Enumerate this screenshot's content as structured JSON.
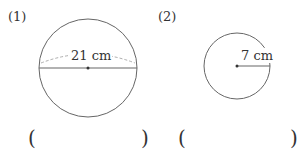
{
  "problems": [
    {
      "label": "(1)",
      "measure": "21 cm",
      "type": "diameter",
      "answer_open": "(",
      "answer_close": ")"
    },
    {
      "label": "(2)",
      "measure": "7 cm",
      "type": "radius",
      "answer_open": "(",
      "answer_close": ")"
    }
  ]
}
